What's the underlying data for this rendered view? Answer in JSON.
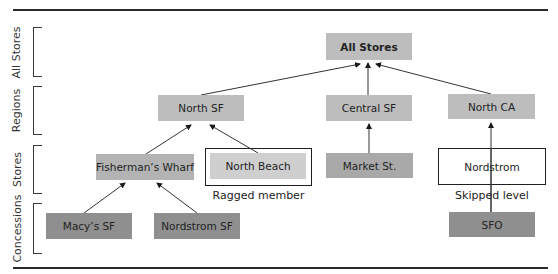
{
  "levels": [
    {
      "label": "All Stores"
    },
    {
      "label": "Regions"
    },
    {
      "label": "Stores"
    },
    {
      "label": "Concessions"
    }
  ],
  "nodes": {
    "all_stores": "All Stores",
    "north_sf": "North SF",
    "central_sf": "Central SF",
    "north_ca": "North CA",
    "fishermans_wharf": "Fisherman’s Wharf",
    "north_beach": "North Beach",
    "market_st": "Market St.",
    "nordstrom": "Nordstrom",
    "macys_sf": "Macy’s SF",
    "nordstrom_sf": "Nordstrom SF",
    "sfo": "SFO"
  },
  "annotations": {
    "ragged_member": "Ragged member",
    "skipped_level": "Skipped level"
  },
  "edges": [
    {
      "from": "North SF",
      "to": "All Stores"
    },
    {
      "from": "Central SF",
      "to": "All Stores"
    },
    {
      "from": "North CA",
      "to": "All Stores"
    },
    {
      "from": "Fisherman’s Wharf",
      "to": "North SF"
    },
    {
      "from": "North Beach",
      "to": "North SF"
    },
    {
      "from": "Market St.",
      "to": "Central SF"
    },
    {
      "from": "SFO",
      "to": "North CA"
    },
    {
      "from": "Macy’s SF",
      "to": "Fisherman’s Wharf"
    },
    {
      "from": "Nordstrom SF",
      "to": "Fisherman’s Wharf"
    }
  ],
  "colors": {
    "level_regions_stores": "#bdbdbd",
    "level_market": "#a9a9a9",
    "level_concessions": "#8f8f8f",
    "ragged_fill": "#cfcfcf",
    "rule": "#2a2a2a"
  }
}
